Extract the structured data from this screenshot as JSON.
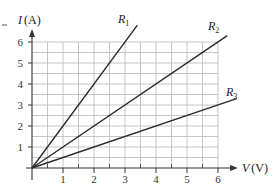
{
  "chart_data": {
    "type": "line",
    "title": "",
    "xlabel": "V (V)",
    "ylabel": "I (A)",
    "xlabel_var": "V",
    "xlabel_unit": "(V)",
    "ylabel_var": "I",
    "ylabel_unit": "(A)",
    "xlim": [
      0,
      6
    ],
    "ylim": [
      0,
      6
    ],
    "x_ticks": [
      "1",
      "2",
      "3",
      "4",
      "5",
      "6"
    ],
    "y_ticks": [
      "1",
      "2",
      "3",
      "4",
      "5",
      "6"
    ],
    "grid": true,
    "grid_minor_step": 0.5,
    "legend_position": "inline-at-line-ends",
    "series": [
      {
        "name": "R1",
        "label_main": "R",
        "label_sub": "1",
        "slope": 2.0,
        "resistance_ohm": 0.5,
        "x": [
          0,
          3.4
        ],
        "y": [
          0,
          6.8
        ]
      },
      {
        "name": "R2",
        "label_main": "R",
        "label_sub": "2",
        "slope": 1.0,
        "resistance_ohm": 1.0,
        "x": [
          0,
          6.3
        ],
        "y": [
          0,
          6.3
        ]
      },
      {
        "name": "R3",
        "label_main": "R",
        "label_sub": "3",
        "slope": 0.5,
        "resistance_ohm": 2.0,
        "x": [
          0,
          6.6
        ],
        "y": [
          0,
          3.3
        ]
      }
    ],
    "colors": {
      "line": "#2a2a2a",
      "grid": "#b8b8b8",
      "axis": "#333333"
    }
  }
}
